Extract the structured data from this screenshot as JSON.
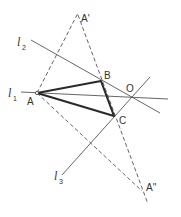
{
  "diagram": {
    "points": {
      "A": {
        "label": "A",
        "x": 37,
        "y": 93
      },
      "B": {
        "label": "B",
        "x": 101,
        "y": 81
      },
      "C": {
        "label": "C",
        "x": 114,
        "y": 116
      },
      "O": {
        "label": "O",
        "x": 132,
        "y": 98
      },
      "A_prime": {
        "label": "A'",
        "x": 78,
        "y": 17
      },
      "A_double_prime": {
        "label": "A''",
        "x": 142,
        "y": 191
      }
    },
    "lines": {
      "l1": {
        "name": "l",
        "subscript": "1"
      },
      "l2": {
        "name": "l",
        "subscript": "2"
      },
      "l3": {
        "name": "l",
        "subscript": "3"
      }
    }
  }
}
